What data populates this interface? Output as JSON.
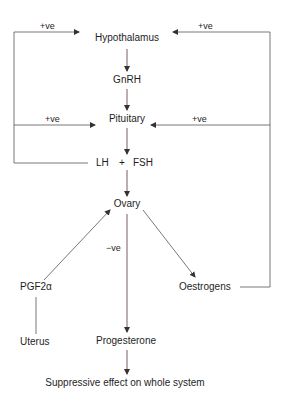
{
  "diagram": {
    "nodes": {
      "hypothalamus": "Hypothalamus",
      "gnrh": "GnRH",
      "pituitary": "Pituitary",
      "lh": "LH",
      "plus": "+",
      "fsh": "FSH",
      "ovary": "Ovary",
      "pgf2a": "PGF2α",
      "uterus": "Uterus",
      "oestrogens": "Oestrogens",
      "progesterone": "Progesterone",
      "suppressive": "Suppressive effect on whole system"
    },
    "edge_labels": {
      "lh_fsh_to_hypothalamus": "+ve",
      "oestrogens_to_hypothalamus": "+ve",
      "lh_fsh_to_pituitary": "+ve",
      "oestrogens_to_pituitary": "+ve",
      "pgf2a_ovary": "−ve"
    },
    "colors": {
      "main_axis": "#6b4a55",
      "lines": "#555555",
      "text": "#1e1e1e"
    }
  }
}
